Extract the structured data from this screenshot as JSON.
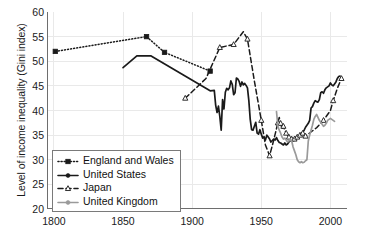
{
  "chart_data": {
    "type": "line",
    "title": "",
    "xlabel": "",
    "ylabel": "Level of income inequality (Gini index)",
    "xlim": [
      1795,
      2012
    ],
    "ylim": [
      20,
      60
    ],
    "xticks": [
      1800,
      1850,
      1900,
      1950,
      2000
    ],
    "xtick_labels": [
      "1800",
      "1850",
      "1900",
      "1950",
      "2000"
    ],
    "x_minor_tick_step": 10,
    "yticks": [
      20,
      25,
      30,
      35,
      40,
      45,
      50,
      55,
      60
    ],
    "ytick_labels": [
      "20",
      "25",
      "30",
      "35",
      "40",
      "45",
      "50",
      "55",
      "60"
    ],
    "grid": true,
    "legend_position": "lower-left-inside",
    "series": [
      {
        "name": "England and Wales",
        "color": "#1a1a1a",
        "linestyle": "dotted",
        "marker": "square",
        "points": [
          [
            1801,
            52.0
          ],
          [
            1867,
            55.0
          ],
          [
            1880,
            51.8
          ],
          [
            1913,
            48.0
          ]
        ]
      },
      {
        "name": "United States",
        "color": "#1a1a1a",
        "linestyle": "solid",
        "marker": "circle",
        "points": [
          [
            1850,
            48.7
          ],
          [
            1860,
            51.1
          ],
          [
            1870,
            51.1
          ],
          [
            1913,
            44.0
          ],
          [
            1916,
            44.1
          ],
          [
            1917,
            41.1
          ],
          [
            1918,
            39.6
          ],
          [
            1919,
            40.9
          ],
          [
            1920,
            38.8
          ],
          [
            1921,
            36.0
          ],
          [
            1922,
            42.2
          ],
          [
            1923,
            40.3
          ],
          [
            1924,
            43.7
          ],
          [
            1925,
            44.5
          ],
          [
            1926,
            44.2
          ],
          [
            1927,
            44.6
          ],
          [
            1928,
            46.0
          ],
          [
            1929,
            45.3
          ],
          [
            1930,
            43.2
          ],
          [
            1931,
            43.6
          ],
          [
            1932,
            46.6
          ],
          [
            1933,
            46.4
          ],
          [
            1934,
            45.9
          ],
          [
            1935,
            44.9
          ],
          [
            1936,
            45.8
          ],
          [
            1937,
            45.2
          ],
          [
            1938,
            45.5
          ],
          [
            1939,
            45.1
          ],
          [
            1940,
            44.6
          ],
          [
            1941,
            42.0
          ],
          [
            1942,
            38.2
          ],
          [
            1943,
            36.1
          ],
          [
            1944,
            36.0
          ],
          [
            1945,
            36.8
          ],
          [
            1946,
            37.6
          ],
          [
            1947,
            35.4
          ],
          [
            1948,
            35.2
          ],
          [
            1949,
            36.1
          ],
          [
            1950,
            35.2
          ],
          [
            1951,
            34.4
          ],
          [
            1952,
            34.6
          ],
          [
            1953,
            34.0
          ],
          [
            1954,
            35.0
          ],
          [
            1955,
            34.6
          ],
          [
            1956,
            34.2
          ],
          [
            1957,
            33.6
          ],
          [
            1958,
            33.9
          ],
          [
            1959,
            34.2
          ],
          [
            1960,
            34.0
          ],
          [
            1961,
            34.5
          ],
          [
            1962,
            33.9
          ],
          [
            1963,
            33.5
          ],
          [
            1964,
            33.4
          ],
          [
            1965,
            33.2
          ],
          [
            1966,
            33.0
          ],
          [
            1967,
            33.4
          ],
          [
            1968,
            33.0
          ],
          [
            1969,
            33.2
          ],
          [
            1970,
            33.6
          ],
          [
            1971,
            34.0
          ],
          [
            1972,
            34.3
          ],
          [
            1973,
            34.1
          ],
          [
            1974,
            34.0
          ],
          [
            1975,
            34.6
          ],
          [
            1976,
            34.4
          ],
          [
            1977,
            34.8
          ],
          [
            1978,
            35.0
          ],
          [
            1979,
            35.4
          ],
          [
            1980,
            35.6
          ],
          [
            1981,
            36.0
          ],
          [
            1982,
            36.6
          ],
          [
            1983,
            37.0
          ],
          [
            1984,
            37.4
          ],
          [
            1985,
            38.0
          ],
          [
            1986,
            40.5
          ],
          [
            1987,
            40.8
          ],
          [
            1988,
            41.5
          ],
          [
            1989,
            42.0
          ],
          [
            1990,
            41.8
          ],
          [
            1991,
            41.7
          ],
          [
            1992,
            42.2
          ],
          [
            1993,
            43.6
          ],
          [
            1994,
            43.8
          ],
          [
            1995,
            43.5
          ],
          [
            1996,
            44.2
          ],
          [
            1997,
            44.6
          ],
          [
            1998,
            44.8
          ],
          [
            1999,
            45.0
          ],
          [
            2000,
            45.6
          ],
          [
            2001,
            45.2
          ],
          [
            2002,
            45.0
          ],
          [
            2003,
            45.4
          ],
          [
            2004,
            45.8
          ],
          [
            2005,
            46.5
          ],
          [
            2006,
            46.9
          ],
          [
            2007,
            47.0
          ]
        ]
      },
      {
        "name": "Japan",
        "color": "#1a1a1a",
        "linestyle": "dashed",
        "marker": "triangle-open",
        "points": [
          [
            1895,
            42.5
          ],
          [
            1910,
            46.5
          ],
          [
            1920,
            52.8
          ],
          [
            1925,
            53.1
          ],
          [
            1930,
            53.4
          ],
          [
            1937,
            56.0
          ],
          [
            1940,
            54.5
          ],
          [
            1945,
            46.0
          ],
          [
            1950,
            38.0
          ],
          [
            1953,
            33.0
          ],
          [
            1956,
            30.8
          ],
          [
            1959,
            34.0
          ],
          [
            1962,
            37.5
          ],
          [
            1963,
            38.6
          ],
          [
            1964,
            37.4
          ],
          [
            1965,
            36.3
          ],
          [
            1966,
            36.8
          ],
          [
            1967,
            36.0
          ],
          [
            1968,
            35.4
          ],
          [
            1969,
            35.0
          ],
          [
            1970,
            34.6
          ],
          [
            1971,
            34.4
          ],
          [
            1972,
            34.2
          ],
          [
            1973,
            34.0
          ],
          [
            1974,
            34.2
          ],
          [
            1975,
            34.4
          ],
          [
            1976,
            34.6
          ],
          [
            1977,
            34.8
          ],
          [
            1978,
            35.0
          ],
          [
            1979,
            35.2
          ],
          [
            1980,
            35.4
          ],
          [
            1981,
            35.0
          ],
          [
            1982,
            34.8
          ],
          [
            1990,
            36.5
          ],
          [
            1995,
            38.0
          ],
          [
            2000,
            40.0
          ],
          [
            2002,
            42.0
          ],
          [
            2005,
            44.5
          ],
          [
            2008,
            46.5
          ]
        ]
      },
      {
        "name": "United Kingdom",
        "color": "#9a9a9a",
        "linestyle": "solid",
        "marker": "circle",
        "points": [
          [
            1961,
            39.8
          ],
          [
            1962,
            36.8
          ],
          [
            1963,
            36.0
          ],
          [
            1964,
            35.4
          ],
          [
            1965,
            34.6
          ],
          [
            1966,
            34.2
          ],
          [
            1967,
            34.4
          ],
          [
            1968,
            34.0
          ],
          [
            1969,
            33.6
          ],
          [
            1970,
            33.8
          ],
          [
            1971,
            34.2
          ],
          [
            1972,
            33.8
          ],
          [
            1973,
            32.6
          ],
          [
            1974,
            31.8
          ],
          [
            1975,
            31.0
          ],
          [
            1976,
            30.0
          ],
          [
            1977,
            29.6
          ],
          [
            1978,
            29.4
          ],
          [
            1979,
            29.6
          ],
          [
            1980,
            29.4
          ],
          [
            1981,
            29.5
          ],
          [
            1982,
            29.8
          ],
          [
            1983,
            30.0
          ],
          [
            1984,
            33.8
          ],
          [
            1985,
            35.0
          ],
          [
            1986,
            36.0
          ],
          [
            1987,
            37.0
          ],
          [
            1988,
            38.2
          ],
          [
            1989,
            38.8
          ],
          [
            1990,
            39.2
          ],
          [
            1991,
            38.6
          ],
          [
            1992,
            38.0
          ],
          [
            1993,
            37.6
          ],
          [
            1994,
            37.2
          ],
          [
            1995,
            36.8
          ],
          [
            1996,
            37.0
          ],
          [
            1997,
            37.4
          ],
          [
            1998,
            38.0
          ],
          [
            1999,
            38.2
          ],
          [
            2000,
            38.4
          ],
          [
            2001,
            38.2
          ],
          [
            2002,
            38.0
          ],
          [
            2003,
            37.8
          ]
        ]
      }
    ],
    "legend": [
      {
        "label": "England and Wales",
        "color": "#1a1a1a",
        "linestyle": "dotted",
        "marker": "square"
      },
      {
        "label": "United States",
        "color": "#1a1a1a",
        "linestyle": "solid",
        "marker": "circle"
      },
      {
        "label": "Japan",
        "color": "#1a1a1a",
        "linestyle": "dashed",
        "marker": "triangle-open"
      },
      {
        "label": "United Kingdom",
        "color": "#9a9a9a",
        "linestyle": "solid",
        "marker": "circle"
      }
    ]
  },
  "style": {
    "axis_color": "#6e6e6e",
    "grid_color": "#e9e9e9",
    "text_color": "#1a1a1a",
    "background": "#ffffff"
  }
}
